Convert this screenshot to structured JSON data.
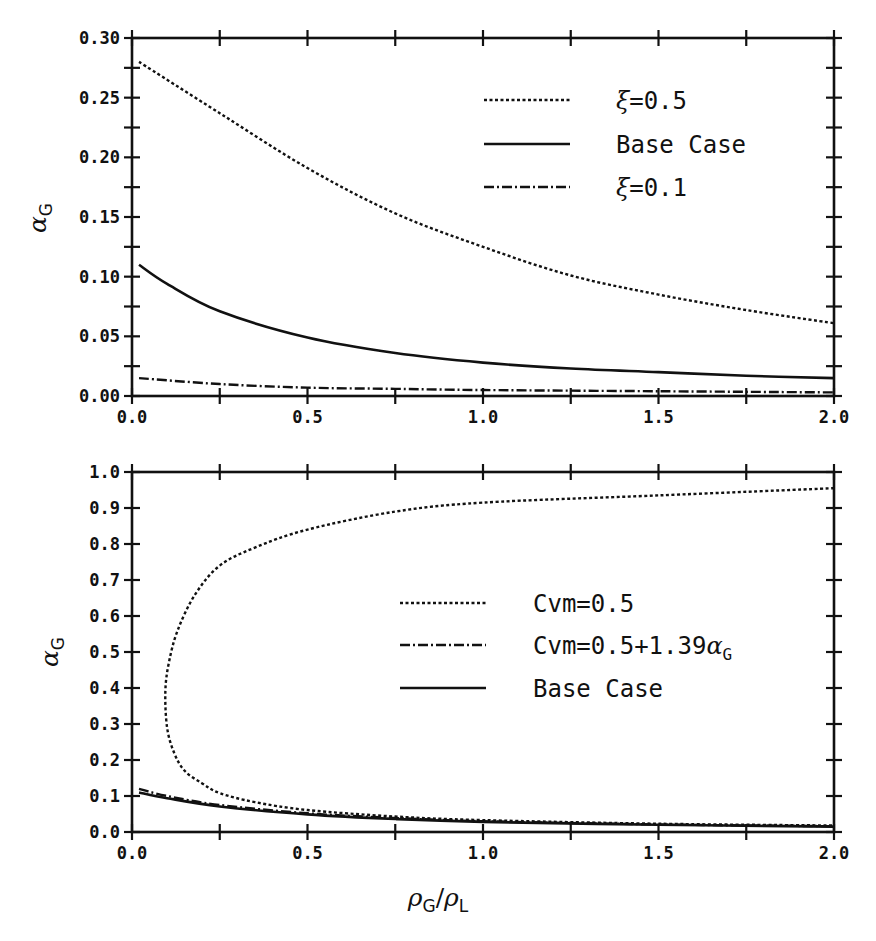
{
  "figure": {
    "xlabel_main": "ρ",
    "xlabel_sub1": "G",
    "xlabel_slash": "/",
    "xlabel_main2": "ρ",
    "xlabel_sub2": "L",
    "ylabel_main": "α",
    "ylabel_sub": "G"
  },
  "chart_data": [
    {
      "type": "line",
      "title": "",
      "xlabel": "ρG/ρL",
      "ylabel": "αG",
      "xlim": [
        0.0,
        2.0
      ],
      "ylim": [
        0.0,
        0.3
      ],
      "xticks": [
        "0.0",
        "0.5",
        "1.0",
        "1.5",
        "2.0"
      ],
      "yticks": [
        "0.00",
        "0.05",
        "0.10",
        "0.15",
        "0.20",
        "0.25",
        "0.30"
      ],
      "grid": false,
      "legend_position": "upper right",
      "series": [
        {
          "name": "ξ=0.5",
          "style": "dotted",
          "x": [
            0.02,
            0.25,
            0.5,
            0.75,
            1.0,
            1.25,
            1.5,
            1.75,
            2.0
          ],
          "y": [
            0.28,
            0.237,
            0.191,
            0.153,
            0.125,
            0.101,
            0.085,
            0.072,
            0.061
          ]
        },
        {
          "name": "Base Case",
          "style": "solid",
          "x": [
            0.02,
            0.1,
            0.25,
            0.5,
            0.75,
            1.0,
            1.25,
            1.5,
            1.75,
            2.0
          ],
          "y": [
            0.11,
            0.094,
            0.071,
            0.049,
            0.036,
            0.028,
            0.023,
            0.02,
            0.017,
            0.015
          ]
        },
        {
          "name": "ξ=0.1",
          "style": "dashdot",
          "x": [
            0.02,
            0.25,
            0.5,
            0.75,
            1.0,
            1.5,
            2.0
          ],
          "y": [
            0.015,
            0.01,
            0.007,
            0.006,
            0.005,
            0.004,
            0.003
          ]
        }
      ]
    },
    {
      "type": "line",
      "title": "",
      "xlabel": "ρG/ρL",
      "ylabel": "αG",
      "xlim": [
        0.0,
        2.0
      ],
      "ylim": [
        0.0,
        1.0
      ],
      "xticks": [
        "0.0",
        "0.5",
        "1.0",
        "1.5",
        "2.0"
      ],
      "yticks": [
        "0.0",
        "0.1",
        "0.2",
        "0.3",
        "0.4",
        "0.5",
        "0.6",
        "0.7",
        "0.8",
        "0.9",
        "1.0"
      ],
      "grid": false,
      "legend_position": "center right",
      "series": [
        {
          "name": "Cvm=0.5",
          "style": "dotted",
          "x": [
            2.0,
            1.5,
            1.0,
            0.75,
            0.5,
            0.35,
            0.25,
            0.18,
            0.13,
            0.105,
            0.095,
            0.1,
            0.12,
            0.15,
            0.2,
            0.25,
            0.35,
            0.5,
            0.75,
            1.0,
            1.5,
            2.0
          ],
          "y": [
            0.955,
            0.935,
            0.915,
            0.89,
            0.84,
            0.79,
            0.74,
            0.66,
            0.56,
            0.47,
            0.39,
            0.29,
            0.22,
            0.17,
            0.135,
            0.108,
            0.083,
            0.061,
            0.043,
            0.033,
            0.023,
            0.018
          ]
        },
        {
          "name": "Cvm=0.5+1.39αG",
          "style": "dashdot",
          "x": [
            0.02,
            0.1,
            0.25,
            0.5,
            0.75,
            1.0,
            1.5,
            2.0
          ],
          "y": [
            0.12,
            0.1,
            0.075,
            0.052,
            0.039,
            0.03,
            0.021,
            0.016
          ]
        },
        {
          "name": "Base Case",
          "style": "solid",
          "x": [
            0.02,
            0.1,
            0.25,
            0.5,
            0.75,
            1.0,
            1.5,
            2.0
          ],
          "y": [
            0.11,
            0.094,
            0.071,
            0.049,
            0.036,
            0.028,
            0.02,
            0.015
          ]
        }
      ]
    }
  ],
  "legends": {
    "top": [
      {
        "prefix": "ξ",
        "text": "=0.5",
        "style": "dotted"
      },
      {
        "prefix": "",
        "text": "Base Case",
        "style": "solid"
      },
      {
        "prefix": "ξ",
        "text": "=0.1",
        "style": "dashdot"
      }
    ],
    "bottom": [
      {
        "text": "Cvm=0.5",
        "sub_main": "",
        "sub": "",
        "style": "dotted"
      },
      {
        "text": "Cvm=0.5+1.39",
        "sub_main": "α",
        "sub": "G",
        "style": "dashdot"
      },
      {
        "text": "Base Case",
        "sub_main": "",
        "sub": "",
        "style": "solid"
      }
    ]
  },
  "colors": {
    "ink": "#111111",
    "background": "#ffffff"
  }
}
